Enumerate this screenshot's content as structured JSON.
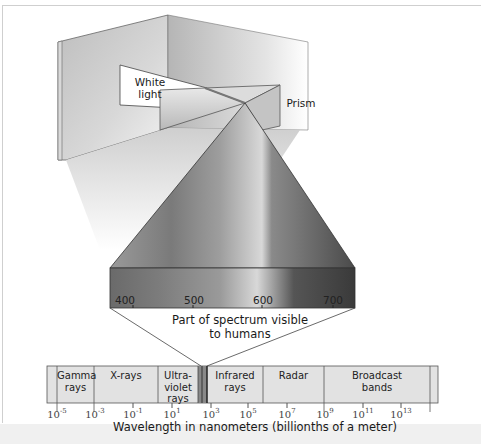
{
  "diagram": {
    "labels": {
      "white_light": [
        "White",
        "light"
      ],
      "prism": "Prism"
    },
    "visible_band": {
      "ticks": [
        "400",
        "500",
        "600",
        "700"
      ],
      "caption_line1": "Part of spectrum visible",
      "caption_line2": "to humans"
    },
    "spectrum_bar": {
      "segments": [
        {
          "label_lines": [
            "Gamma",
            "rays"
          ]
        },
        {
          "label_lines": [
            "X-rays"
          ]
        },
        {
          "label_lines": [
            "Ultra-",
            "violet",
            "rays"
          ]
        },
        {
          "label_lines": [
            "Infrared",
            "rays"
          ]
        },
        {
          "label_lines": [
            "Radar"
          ]
        },
        {
          "label_lines": [
            "Broadcast",
            "bands"
          ]
        }
      ],
      "tick_base": "10",
      "tick_exponents": [
        "-5",
        "-3",
        "-1",
        "1",
        "3",
        "5",
        "7",
        "9",
        "11",
        "13"
      ],
      "axis_title": "Wavelength in nanometers (billionths of a meter)"
    },
    "colors": {
      "bar_fill": "#e2e2e2",
      "bar_stroke": "#555555",
      "frame": "#cfcfcf",
      "bottom_strip": "#f0f0f0"
    }
  }
}
